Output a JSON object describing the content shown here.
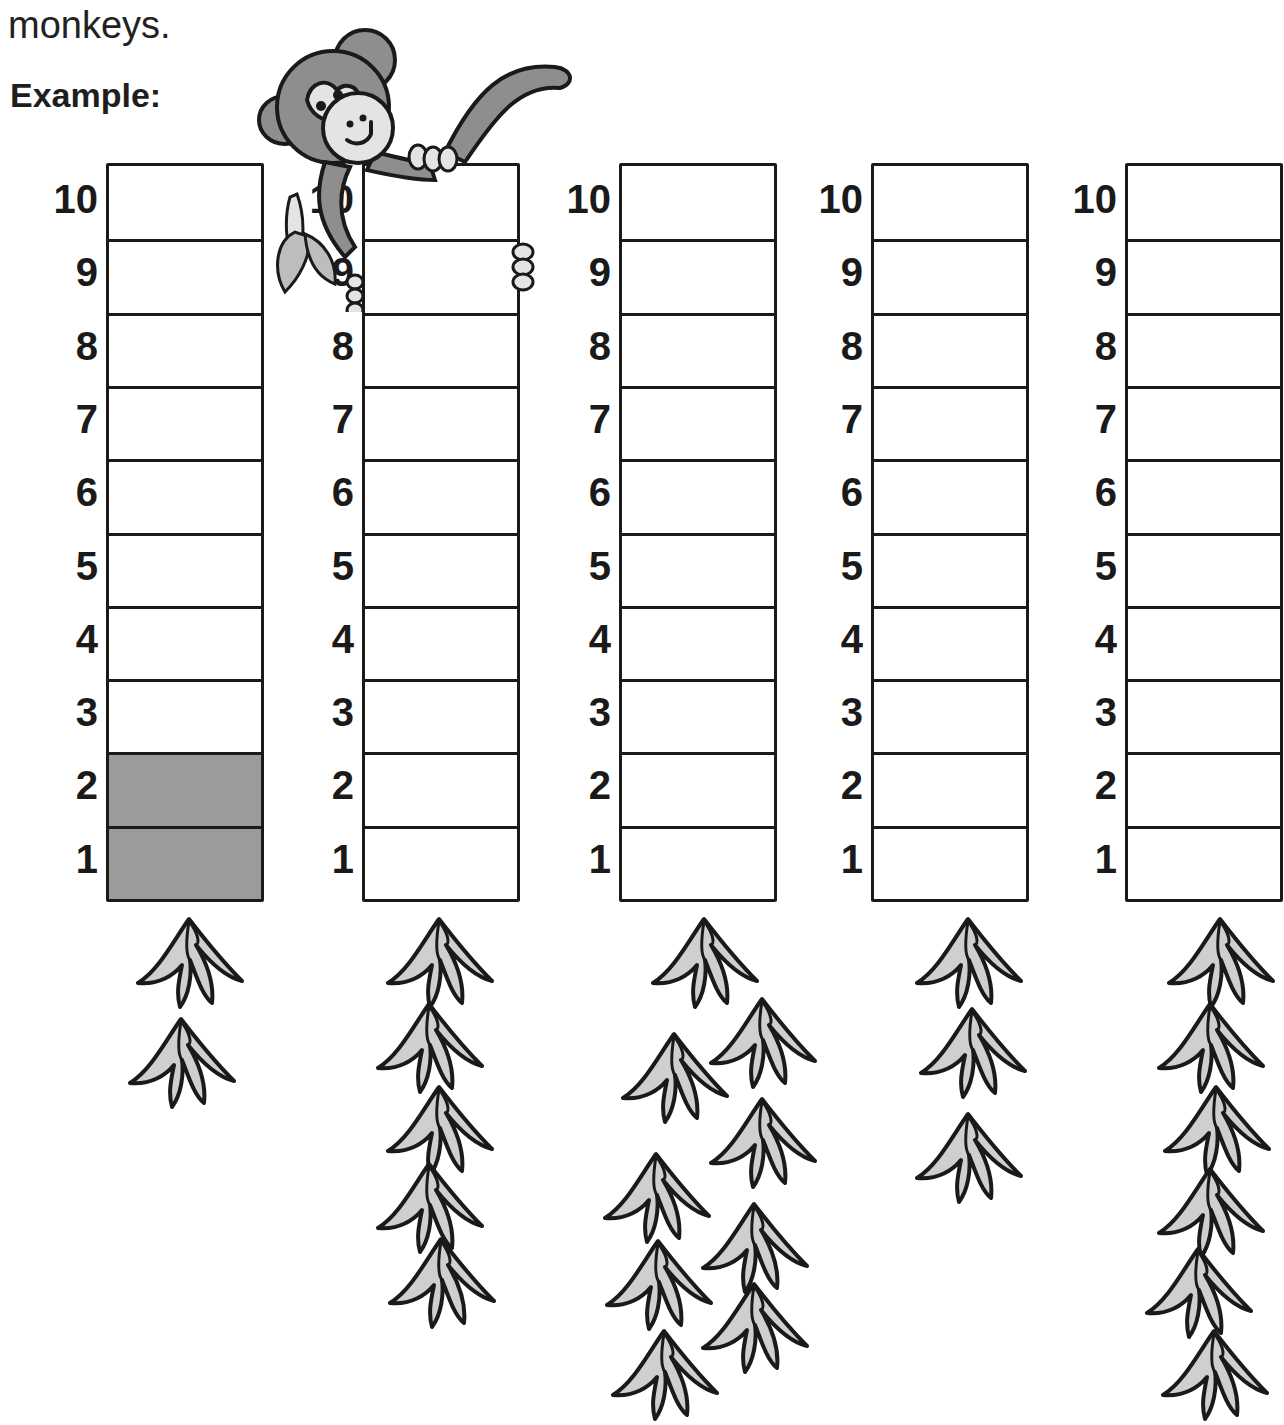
{
  "worksheet": {
    "intro_text_tail": "monkeys.",
    "example_label": "Example:",
    "scale_labels": [
      "10",
      "9",
      "8",
      "7",
      "6",
      "5",
      "4",
      "3",
      "2",
      "1"
    ],
    "colors": {
      "outline": "#1a1a1a",
      "filled_cell": "#9b9b9b",
      "banana_fill": "#cfcfcf",
      "monkey_dark": "#8e8e8e",
      "monkey_light": "#e4e4e4"
    },
    "graphs": [
      {
        "id": "example",
        "filled_cells": 2,
        "banana_bunches": 2,
        "is_example": true
      },
      {
        "id": "graph-2",
        "filled_cells": 0,
        "banana_bunches": 5,
        "is_example": false
      },
      {
        "id": "graph-3",
        "filled_cells": 0,
        "banana_bunches": 9,
        "is_example": false
      },
      {
        "id": "graph-4",
        "filled_cells": 0,
        "banana_bunches": 3,
        "is_example": false
      },
      {
        "id": "graph-5",
        "filled_cells": 0,
        "banana_bunches": 6,
        "is_example": false
      }
    ]
  },
  "chart_data": {
    "type": "bar",
    "categories": [
      "Example",
      "Graph 2",
      "Graph 3",
      "Graph 4",
      "Graph 5"
    ],
    "series": [
      {
        "name": "Shaded cells",
        "values": [
          2,
          0,
          0,
          0,
          0
        ]
      },
      {
        "name": "Banana bunches shown",
        "values": [
          2,
          5,
          9,
          3,
          6
        ]
      }
    ],
    "ylim": [
      0,
      10
    ],
    "ytick_labels": [
      "1",
      "2",
      "3",
      "4",
      "5",
      "6",
      "7",
      "8",
      "9",
      "10"
    ],
    "grid": true,
    "xlabel": "",
    "ylabel": ""
  }
}
